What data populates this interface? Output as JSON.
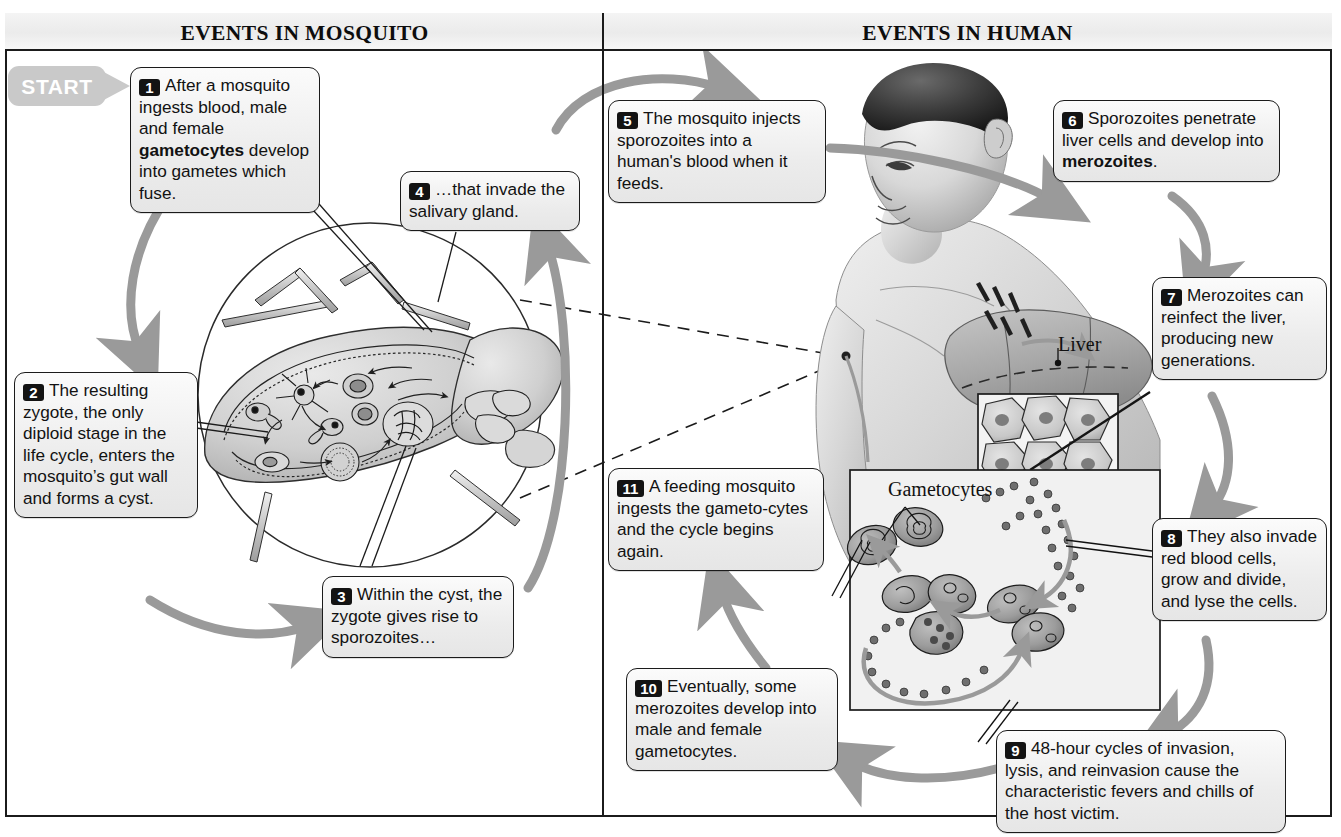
{
  "headers": {
    "left": "EVENTS IN MOSQUITO",
    "right": "EVENTS IN HUMAN"
  },
  "start_badge": {
    "label": "START"
  },
  "art_labels": {
    "liver": "Liver",
    "gametocytes": "Gametocytes"
  },
  "colors": {
    "ink": "#1b1b1b",
    "box_fill": "#ececec",
    "arrow_gray": "#9a9a9a",
    "badge_gray": "#c9c9c9",
    "number_badge": "#131313"
  },
  "steps": [
    {
      "number": "1",
      "text_parts": [
        {
          "t": "After a mosquito ingests blood, male and female ",
          "bold": false
        },
        {
          "t": "gametocytes",
          "bold": true
        },
        {
          "t": " develop into gametes which fuse.",
          "bold": false
        }
      ],
      "plain": "After a mosquito ingests blood, male and female gametocytes develop into gametes which fuse.",
      "side": "mosquito"
    },
    {
      "number": "2",
      "text_parts": [
        {
          "t": "The resulting zygote, the only diploid stage in the life cycle, enters the mosquito’s gut wall and forms a cyst.",
          "bold": false
        }
      ],
      "plain": "The resulting zygote, the only diploid stage in the life cycle, enters the mosquito’s gut wall and forms a cyst.",
      "side": "mosquito"
    },
    {
      "number": "3",
      "text_parts": [
        {
          "t": "Within the cyst, the zygote gives rise to sporozoites…",
          "bold": false
        }
      ],
      "plain": "Within the cyst, the zygote gives rise to sporozoites…",
      "side": "mosquito"
    },
    {
      "number": "4",
      "text_parts": [
        {
          "t": "…that invade the salivary gland.",
          "bold": false
        }
      ],
      "plain": "…that invade the salivary gland.",
      "side": "mosquito"
    },
    {
      "number": "5",
      "text_parts": [
        {
          "t": "The mosquito injects sporozoites into a human's blood when it feeds.",
          "bold": false
        }
      ],
      "plain": "The mosquito injects sporozoites into a human's blood when it feeds.",
      "side": "human"
    },
    {
      "number": "6",
      "text_parts": [
        {
          "t": "Sporozoites penetrate liver cells and develop into ",
          "bold": false
        },
        {
          "t": "merozoites",
          "bold": true
        },
        {
          "t": ".",
          "bold": false
        }
      ],
      "plain": "Sporozoites penetrate liver cells and develop into merozoites.",
      "side": "human"
    },
    {
      "number": "7",
      "text_parts": [
        {
          "t": "Merozoites can reinfect the liver, producing new generations.",
          "bold": false
        }
      ],
      "plain": "Merozoites can reinfect the liver, producing new generations.",
      "side": "human"
    },
    {
      "number": "8",
      "text_parts": [
        {
          "t": "They also invade red blood cells, grow and divide, and lyse the cells.",
          "bold": false
        }
      ],
      "plain": "They also invade red blood cells, grow and divide, and lyse the cells.",
      "side": "human"
    },
    {
      "number": "9",
      "text_parts": [
        {
          "t": "48-hour cycles of invasion, lysis, and reinvasion cause the characteristic fevers and chills of the host victim.",
          "bold": false
        }
      ],
      "plain": "48-hour cycles of invasion, lysis, and reinvasion cause the characteristic fevers and chills of the host victim.",
      "side": "human"
    },
    {
      "number": "10",
      "text_parts": [
        {
          "t": "Eventually, some merozoites develop into male and female gametocytes.",
          "bold": false
        }
      ],
      "plain": "Eventually, some merozoites develop into male and female gametocytes.",
      "side": "human"
    },
    {
      "number": "11",
      "text_parts": [
        {
          "t": "A feeding mosquito ingests the gameto-cytes and the cycle begins again.",
          "bold": false
        }
      ],
      "plain": "A feeding mosquito ingests the gameto-cytes and the cycle begins again.",
      "side": "human"
    }
  ]
}
